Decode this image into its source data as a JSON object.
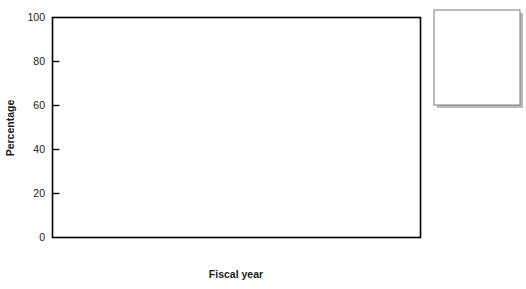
{
  "chart_data": {
    "type": "area",
    "stacked": true,
    "title": "",
    "xlabel": "Fiscal year",
    "ylabel": "Percentage",
    "x": [
      2000,
      2001,
      2002,
      2003,
      2004,
      2005,
      2006,
      2007,
      2008
    ],
    "categories": [
      "2000",
      "2001",
      "2002",
      "2003",
      "2004",
      "2005",
      "2006",
      "2007",
      "2008"
    ],
    "xlim": [
      2000,
      2008
    ],
    "ylim": [
      0,
      100
    ],
    "yticks": [
      0,
      20,
      40,
      60,
      80,
      100
    ],
    "ytick_labels": [
      "0",
      "20",
      "40",
      "60",
      "80",
      "100"
    ],
    "xticks": [
      2000,
      2001,
      2002,
      2003,
      2004,
      2005,
      2006,
      2007,
      2008
    ],
    "grid": false,
    "legend_position": "right",
    "stack_order_bottom_to_top": [
      "Other",
      "Cash",
      "HiGrad",
      "PaYS",
      "Seasonal"
    ],
    "series": [
      {
        "name": "Seasonal",
        "color": "#3a3a3a",
        "values": [
          12,
          20,
          11,
          4,
          6,
          4.5,
          6,
          7,
          9
        ]
      },
      {
        "name": "PaYS",
        "color": "#2b2b2b",
        "values": [
          1,
          4,
          1,
          9,
          8,
          10,
          9,
          14,
          18
        ]
      },
      {
        "name": "HiGrad",
        "color": "#8a8a8a",
        "values": [
          14,
          13,
          17,
          16,
          25,
          25,
          22,
          24,
          22
        ]
      },
      {
        "name": "Cash",
        "color": "#d4d4d4",
        "values": [
          35,
          36.5,
          43.5,
          44,
          41.5,
          30,
          35,
          32,
          31
        ]
      },
      {
        "name": "Other",
        "color": "#b0b0b0",
        "values": [
          38,
          26.5,
          27.5,
          27,
          19.5,
          30.5,
          28,
          23,
          20
        ]
      }
    ],
    "cumulative_boundaries": {
      "Other_top": [
        38,
        26.5,
        27.5,
        27,
        19.5,
        30.5,
        28,
        23,
        20
      ],
      "Cash_top": [
        73,
        63,
        71,
        71,
        61,
        60.5,
        63,
        55,
        51
      ],
      "HiGrad_top": [
        87,
        76,
        88,
        87,
        86,
        85.5,
        85,
        79,
        73
      ],
      "PaYS_top": [
        88,
        80,
        89,
        96,
        94,
        95.5,
        94,
        93,
        91
      ],
      "Seasonal_top": [
        100,
        100,
        100,
        100,
        100,
        100,
        100,
        100,
        100
      ]
    }
  },
  "legend": {
    "items": [
      {
        "label": "Seasonal",
        "color": "#3a3a3a"
      },
      {
        "label": "PaYS",
        "color": "#2b2b2b"
      },
      {
        "label": "HiGrad",
        "color": "#8a8a8a"
      },
      {
        "label": "Cash",
        "color": "#d4d4d4"
      },
      {
        "label": "Other",
        "color": "#b0b0b0"
      }
    ]
  },
  "axes": {
    "ylabel": "Percentage",
    "xlabel": "Fiscal year",
    "ytick_labels": [
      "0",
      "20",
      "40",
      "60",
      "80",
      "100"
    ],
    "xtick_labels": [
      "2000",
      "2001",
      "2002",
      "2003",
      "2004",
      "2005",
      "2006",
      "2007",
      "2008"
    ]
  },
  "style": {
    "plot_border": "#000000",
    "background": "#ffffff",
    "series_outline": "#000000"
  }
}
